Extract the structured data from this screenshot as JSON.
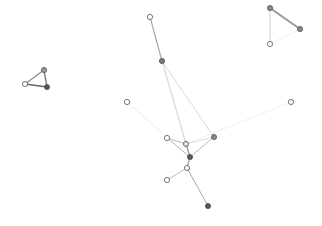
{
  "graph": {
    "type": "network",
    "nodes": [
      {
        "id": "n1",
        "x": 44,
        "y": 70,
        "fill": "#9a9a9a"
      },
      {
        "id": "n2",
        "x": 25,
        "y": 84,
        "fill": "#ffffff"
      },
      {
        "id": "n3",
        "x": 47,
        "y": 87,
        "fill": "#555555"
      },
      {
        "id": "n4",
        "x": 270,
        "y": 8,
        "fill": "#888888"
      },
      {
        "id": "n5",
        "x": 300,
        "y": 29,
        "fill": "#888888"
      },
      {
        "id": "n6",
        "x": 270,
        "y": 44,
        "fill": "#ffffff"
      },
      {
        "id": "n7",
        "x": 150,
        "y": 17,
        "fill": "#ffffff"
      },
      {
        "id": "n8",
        "x": 162,
        "y": 61,
        "fill": "#777777"
      },
      {
        "id": "n9",
        "x": 127,
        "y": 102,
        "fill": "#ffffff"
      },
      {
        "id": "n10",
        "x": 291,
        "y": 102,
        "fill": "#ffffff"
      },
      {
        "id": "n11",
        "x": 167,
        "y": 138,
        "fill": "#ffffff"
      },
      {
        "id": "n12",
        "x": 186,
        "y": 144,
        "fill": "#dddddd"
      },
      {
        "id": "n13",
        "x": 214,
        "y": 137,
        "fill": "#888888"
      },
      {
        "id": "n14",
        "x": 190,
        "y": 157,
        "fill": "#555555"
      },
      {
        "id": "n15",
        "x": 187,
        "y": 168,
        "fill": "#ffffff"
      },
      {
        "id": "n16",
        "x": 167,
        "y": 180,
        "fill": "#ffffff"
      },
      {
        "id": "n17",
        "x": 208,
        "y": 206,
        "fill": "#555555"
      }
    ],
    "edges": [
      {
        "from": "n1",
        "to": "n2",
        "stroke": "#888888",
        "width": 1.2
      },
      {
        "from": "n1",
        "to": "n3",
        "stroke": "#777777",
        "width": 1.4
      },
      {
        "from": "n2",
        "to": "n3",
        "stroke": "#666666",
        "width": 1.6
      },
      {
        "from": "n4",
        "to": "n5",
        "stroke": "#999999",
        "width": 2
      },
      {
        "from": "n4",
        "to": "n6",
        "stroke": "#cccccc",
        "width": 1
      },
      {
        "from": "n5",
        "to": "n6",
        "stroke": "#eeeeee",
        "width": 1
      },
      {
        "from": "n7",
        "to": "n8",
        "stroke": "#aaaaaa",
        "width": 1.2
      },
      {
        "from": "n8",
        "to": "n12",
        "stroke": "#cfcfcf",
        "width": 1
      },
      {
        "from": "n8",
        "to": "n13",
        "stroke": "#d8d8d8",
        "width": 1
      },
      {
        "from": "n8",
        "to": "n14",
        "stroke": "#dddddd",
        "width": 1
      },
      {
        "from": "n9",
        "to": "n14",
        "stroke": "#eeeeee",
        "width": 1
      },
      {
        "from": "n10",
        "to": "n12",
        "stroke": "#eeeeee",
        "width": 1
      },
      {
        "from": "n11",
        "to": "n12",
        "stroke": "#bbbbbb",
        "width": 1
      },
      {
        "from": "n11",
        "to": "n14",
        "stroke": "#bbbbbb",
        "width": 1
      },
      {
        "from": "n12",
        "to": "n14",
        "stroke": "#999999",
        "width": 1.2
      },
      {
        "from": "n12",
        "to": "n13",
        "stroke": "#dddddd",
        "width": 1
      },
      {
        "from": "n13",
        "to": "n14",
        "stroke": "#bbbbbb",
        "width": 1
      },
      {
        "from": "n14",
        "to": "n15",
        "stroke": "#999999",
        "width": 1.2
      },
      {
        "from": "n15",
        "to": "n16",
        "stroke": "#bbbbbb",
        "width": 1
      },
      {
        "from": "n15",
        "to": "n17",
        "stroke": "#aaaaaa",
        "width": 1
      }
    ],
    "node_radius": 2.6,
    "node_stroke": "#555555"
  }
}
